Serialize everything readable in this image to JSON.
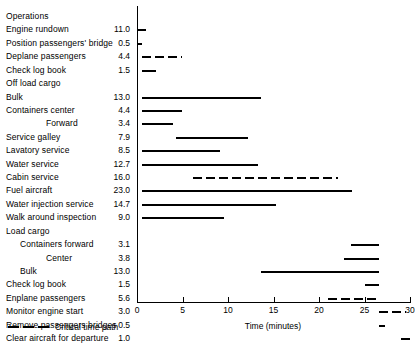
{
  "chart_data": {
    "type": "bar",
    "subtype": "gantt",
    "title": "",
    "xlabel": "Time (minutes)",
    "ylabel": "Operations",
    "xlim": [
      0,
      30
    ],
    "xticks": [
      0,
      5,
      10,
      15,
      20,
      25,
      30
    ],
    "xticklabels": [
      "0",
      "5",
      "10",
      "15",
      "20",
      "25",
      "30"
    ],
    "grid": false,
    "column_headers": {
      "operations": "Operations",
      "duration": ""
    },
    "legend": {
      "position": "bottom-left",
      "entries": [
        {
          "label": "Critical time path",
          "style": "dashed"
        }
      ]
    },
    "tasks": [
      {
        "label": "Operations",
        "indent": 0,
        "duration": null,
        "bars": [],
        "is_header": true
      },
      {
        "label": "Engine rundown",
        "indent": 0,
        "duration": "11.0",
        "bars": [
          {
            "start": 0.0,
            "end": 1.0,
            "style": "dashed"
          }
        ]
      },
      {
        "label": "Position passengers' bridge",
        "indent": 0,
        "duration": "0.5",
        "bars": [
          {
            "start": 0.0,
            "end": 0.6,
            "style": "solid"
          }
        ]
      },
      {
        "label": "Deplane passengers",
        "indent": 0,
        "duration": "4.4",
        "bars": [
          {
            "start": 0.6,
            "end": 5.0,
            "style": "dashed"
          }
        ]
      },
      {
        "label": "Check log book",
        "indent": 0,
        "duration": "1.5",
        "bars": [
          {
            "start": 0.6,
            "end": 2.1,
            "style": "solid"
          }
        ]
      },
      {
        "label": "Off load cargo",
        "indent": 0,
        "duration": null,
        "bars": []
      },
      {
        "label": "Bulk",
        "indent": 0,
        "duration": "13.0",
        "bars": [
          {
            "start": 0.6,
            "end": 13.6,
            "style": "solid"
          }
        ]
      },
      {
        "label": "Containers center",
        "indent": 0,
        "duration": "4.4",
        "bars": [
          {
            "start": 0.6,
            "end": 5.0,
            "style": "solid"
          }
        ]
      },
      {
        "label": "Forward",
        "indent": 2,
        "duration": "3.4",
        "bars": [
          {
            "start": 0.6,
            "end": 4.0,
            "style": "solid"
          }
        ]
      },
      {
        "label": "Service galley",
        "indent": 0,
        "duration": "7.9",
        "bars": [
          {
            "start": 4.3,
            "end": 12.2,
            "style": "solid"
          }
        ]
      },
      {
        "label": "Lavatory service",
        "indent": 0,
        "duration": "8.5",
        "bars": [
          {
            "start": 0.6,
            "end": 9.1,
            "style": "solid"
          }
        ]
      },
      {
        "label": "Water service",
        "indent": 0,
        "duration": "12.7",
        "bars": [
          {
            "start": 0.6,
            "end": 13.3,
            "style": "solid"
          }
        ]
      },
      {
        "label": "Cabin service",
        "indent": 0,
        "duration": "16.0",
        "bars": [
          {
            "start": 6.1,
            "end": 22.1,
            "style": "dashed"
          }
        ]
      },
      {
        "label": "Fuel aircraft",
        "indent": 0,
        "duration": "23.0",
        "bars": [
          {
            "start": 0.6,
            "end": 23.6,
            "style": "solid"
          }
        ]
      },
      {
        "label": "Water injection service",
        "indent": 0,
        "duration": "14.7",
        "bars": [
          {
            "start": 0.6,
            "end": 15.3,
            "style": "solid"
          }
        ]
      },
      {
        "label": "Walk around inspection",
        "indent": 0,
        "duration": "9.0",
        "bars": [
          {
            "start": 0.6,
            "end": 9.6,
            "style": "solid"
          }
        ]
      },
      {
        "label": "Load cargo",
        "indent": 0,
        "duration": null,
        "bars": []
      },
      {
        "label": "Containers forward",
        "indent": 1,
        "duration": "3.1",
        "bars": [
          {
            "start": 23.5,
            "end": 26.6,
            "style": "solid"
          }
        ]
      },
      {
        "label": "Center",
        "indent": 2,
        "duration": "3.8",
        "bars": [
          {
            "start": 22.8,
            "end": 26.6,
            "style": "solid"
          }
        ]
      },
      {
        "label": "Bulk",
        "indent": 1,
        "duration": "13.0",
        "bars": [
          {
            "start": 13.6,
            "end": 26.6,
            "style": "solid"
          }
        ]
      },
      {
        "label": "Check log book",
        "indent": 0,
        "duration": "1.5",
        "bars": [
          {
            "start": 25.1,
            "end": 26.6,
            "style": "solid"
          }
        ]
      },
      {
        "label": "Enplane passengers",
        "indent": 0,
        "duration": "5.6",
        "bars": [
          {
            "start": 21.0,
            "end": 26.6,
            "style": "dashed"
          }
        ]
      },
      {
        "label": "Monitor engine start",
        "indent": 0,
        "duration": "3.0",
        "bars": [
          {
            "start": 26.6,
            "end": 29.6,
            "style": "dashed"
          }
        ]
      },
      {
        "label": "Remove passengers bridges",
        "indent": 0,
        "duration": "0.5",
        "bars": [
          {
            "start": 26.6,
            "end": 27.2,
            "style": "solid"
          }
        ]
      },
      {
        "label": "Clear aircraft for departure",
        "indent": 0,
        "duration": "1.0",
        "bars": [
          {
            "start": 29.0,
            "end": 30.0,
            "style": "solid"
          }
        ]
      }
    ]
  },
  "layout": {
    "plot_left_px": 137,
    "plot_right_px": 410,
    "first_row_y_px": 12,
    "row_height_px": 13.42,
    "label_x_px": 6,
    "value_right_px": 130,
    "indent_px": [
      0,
      14,
      40
    ],
    "axis_top_px": 6,
    "axis_bottom_px": 302
  }
}
